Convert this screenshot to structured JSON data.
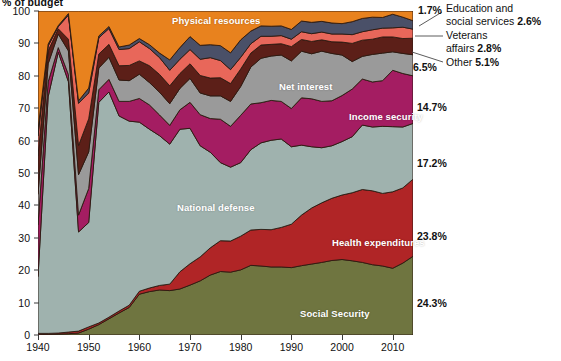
{
  "title": "% of budget",
  "axes": {
    "y_ticks": [
      0,
      10,
      20,
      30,
      40,
      50,
      60,
      70,
      80,
      90,
      100
    ],
    "x_ticks": [
      1940,
      1950,
      1960,
      1970,
      1980,
      1990,
      2000,
      2010
    ],
    "ylim": [
      0,
      100
    ],
    "xlim": [
      1940,
      2014
    ]
  },
  "series_labels": {
    "physical_resources": "Physical resources",
    "net_interest": "Net interest",
    "income_security": "Income security",
    "national_defense": "National defense",
    "health_expenditures": "Health expenditures",
    "social_security": "Social Security"
  },
  "callouts": {
    "p_17": "1.7%",
    "p_65": "6.5%",
    "p_147": "14.7%",
    "p_172": "17.2%",
    "p_238": "23.8%",
    "p_243": "24.3%",
    "education_line1": "Education and",
    "education_line2": "social services",
    "education_value": "2.6%",
    "veterans_line1": "Veterans",
    "veterans_line2": "affairs",
    "veterans_value": "2.8%",
    "other_label": "Other",
    "other_value": "5.1%"
  },
  "colors": {
    "social_security": "#6f7540",
    "health_expenditures": "#b02526",
    "national_defense": "#9fb2ae",
    "income_security": "#a41d62",
    "net_interest": "#9a9a9a",
    "other": "#5c1f18",
    "veterans": "#e8675a",
    "education": "#4a5068",
    "physical_resources": "#e8821e",
    "outline": "#2b1a12",
    "axis": "#3a3a3a",
    "background": "#ffffff",
    "label_text": "#ffffff"
  },
  "chart_data": {
    "type": "area",
    "title": "% of budget",
    "xlabel": "",
    "ylabel": "% of budget",
    "ylim": [
      0,
      100
    ],
    "xlim": [
      1940,
      2014
    ],
    "grid": false,
    "legend": "in-plot labels",
    "stacked": true,
    "normalized_percent": true,
    "x": [
      1940,
      1942,
      1944,
      1946,
      1948,
      1950,
      1952,
      1954,
      1956,
      1958,
      1960,
      1962,
      1964,
      1966,
      1968,
      1970,
      1972,
      1974,
      1976,
      1978,
      1980,
      1982,
      1984,
      1986,
      1988,
      1990,
      1992,
      1994,
      1996,
      1998,
      2000,
      2002,
      2004,
      2006,
      2008,
      2010,
      2012,
      2014
    ],
    "stack_order_bottom_to_top": [
      "Social Security",
      "Health expenditures",
      "National defense",
      "Income security",
      "Net interest",
      "Other",
      "Veterans affairs",
      "Education and social services",
      "Physical resources"
    ],
    "series": [
      {
        "name": "Social Security",
        "color": "#6f7540",
        "final_pct": 24.3,
        "values": [
          0.1,
          0.2,
          0.3,
          0.4,
          0.6,
          1.8,
          3.2,
          5.0,
          6.8,
          8.5,
          12.6,
          13.4,
          13.9,
          13.7,
          14.2,
          15.4,
          16.7,
          18.5,
          19.6,
          19.4,
          20.1,
          21.5,
          21.3,
          21.0,
          21.0,
          20.8,
          21.4,
          21.9,
          22.4,
          23.0,
          23.3,
          22.9,
          22.4,
          21.7,
          21.3,
          20.6,
          22.2,
          24.3
        ]
      },
      {
        "name": "Health expenditures",
        "color": "#b02526",
        "final_pct": 23.8,
        "values": [
          0.4,
          0.3,
          0.3,
          0.5,
          0.6,
          0.7,
          0.5,
          0.5,
          0.6,
          0.7,
          0.9,
          1.1,
          1.4,
          2.0,
          5.3,
          6.6,
          7.4,
          8.4,
          9.5,
          9.6,
          10.4,
          10.9,
          11.3,
          11.5,
          12.2,
          13.4,
          15.6,
          17.3,
          18.4,
          19.2,
          19.9,
          21.0,
          22.5,
          22.8,
          22.4,
          23.6,
          23.2,
          23.8
        ]
      },
      {
        "name": "National defense",
        "color": "#9fb2ae",
        "final_pct": 17.2,
        "values": [
          17.5,
          73.0,
          86.7,
          77.3,
          30.6,
          32.2,
          68.1,
          69.5,
          60.2,
          56.8,
          52.2,
          49.0,
          46.2,
          43.2,
          44.0,
          41.8,
          34.3,
          29.5,
          24.1,
          22.8,
          22.7,
          24.8,
          26.7,
          27.6,
          27.3,
          23.9,
          21.6,
          18.9,
          17.0,
          16.2,
          16.5,
          17.3,
          19.9,
          19.7,
          20.7,
          20.1,
          18.8,
          17.2
        ]
      },
      {
        "name": "Income security",
        "color": "#a41d62",
        "final_pct": 14.7,
        "values": [
          16.0,
          4.6,
          1.4,
          2.2,
          5.2,
          10.5,
          3.9,
          3.9,
          4.5,
          6.1,
          7.3,
          7.5,
          6.4,
          5.8,
          6.0,
          8.0,
          9.6,
          10.4,
          13.4,
          12.6,
          14.6,
          14.1,
          12.4,
          12.3,
          11.6,
          11.8,
          14.6,
          14.8,
          14.3,
          13.9,
          14.2,
          14.7,
          14.2,
          13.9,
          14.1,
          17.4,
          16.5,
          14.7
        ]
      },
      {
        "name": "Net interest",
        "color": "#9a9a9a",
        "final_pct": 6.5,
        "values": [
          9.4,
          5.6,
          4.2,
          7.3,
          12.5,
          11.3,
          6.7,
          6.8,
          6.6,
          6.4,
          7.5,
          6.9,
          7.0,
          6.7,
          6.6,
          7.4,
          6.7,
          7.0,
          7.2,
          7.7,
          8.9,
          11.4,
          13.7,
          13.7,
          14.3,
          14.7,
          14.4,
          13.9,
          15.5,
          14.6,
          12.5,
          8.5,
          7.0,
          8.5,
          8.5,
          5.7,
          6.2,
          6.5
        ]
      },
      {
        "name": "Other",
        "color": "#5c1f18",
        "final_pct": 5.1,
        "values": [
          12.0,
          4.0,
          1.6,
          3.6,
          9.0,
          10.2,
          4.3,
          4.0,
          4.4,
          4.7,
          4.1,
          5.2,
          5.5,
          5.5,
          4.6,
          4.5,
          5.4,
          5.5,
          5.6,
          5.5,
          5.4,
          4.3,
          4.1,
          3.6,
          3.5,
          4.4,
          3.6,
          3.8,
          3.5,
          3.6,
          4.0,
          5.6,
          5.0,
          4.7,
          5.0,
          4.6,
          4.6,
          5.1
        ]
      },
      {
        "name": "Veterans affairs",
        "color": "#e8675a",
        "final_pct": 2.8,
        "values": [
          6.0,
          1.5,
          0.7,
          7.4,
          13.0,
          8.0,
          5.0,
          4.9,
          5.0,
          5.2,
          5.9,
          5.3,
          5.2,
          4.8,
          4.4,
          4.4,
          5.0,
          6.3,
          5.3,
          4.3,
          3.6,
          2.9,
          2.7,
          2.5,
          2.5,
          2.3,
          2.4,
          2.4,
          2.4,
          2.4,
          2.5,
          2.7,
          2.6,
          2.9,
          2.7,
          2.8,
          3.5,
          2.8
        ]
      },
      {
        "name": "Education and social services",
        "color": "#4a5068",
        "final_pct": 2.6,
        "values": [
          2.0,
          0.6,
          0.3,
          0.5,
          0.8,
          1.5,
          0.6,
          0.6,
          0.8,
          1.1,
          1.0,
          1.2,
          1.4,
          3.2,
          3.6,
          4.0,
          4.3,
          4.0,
          4.6,
          5.2,
          5.4,
          3.9,
          3.2,
          3.1,
          3.0,
          3.0,
          3.3,
          3.5,
          3.3,
          3.4,
          3.2,
          4.0,
          4.1,
          3.9,
          3.3,
          4.2,
          3.1,
          2.6
        ]
      },
      {
        "name": "Physical resources",
        "color": "#e8821e",
        "final_pct": 3.0,
        "values": [
          36.6,
          10.2,
          4.5,
          0.8,
          27.7,
          23.8,
          7.7,
          4.8,
          11.1,
          10.5,
          8.5,
          10.4,
          13.0,
          15.1,
          11.3,
          7.9,
          10.6,
          10.4,
          10.7,
          12.9,
          8.9,
          6.2,
          4.6,
          4.7,
          4.6,
          5.7,
          3.1,
          3.5,
          3.2,
          3.7,
          3.9,
          3.3,
          2.3,
          1.9,
          2.0,
          1.0,
          1.9,
          3.0
        ]
      }
    ],
    "annotations": [
      {
        "text": "1.7%",
        "at_series": "Education and social services",
        "note": "right-edge callout"
      },
      {
        "text": "Education and social services 2.6%",
        "at_series": "Education and social services"
      },
      {
        "text": "Veterans affairs 2.8%",
        "at_series": "Veterans affairs"
      },
      {
        "text": "Other 5.1%",
        "at_series": "Other"
      },
      {
        "text": "6.5%",
        "at_series": "Net interest"
      },
      {
        "text": "14.7%",
        "at_series": "Income security"
      },
      {
        "text": "17.2%",
        "at_series": "National defense"
      },
      {
        "text": "23.8%",
        "at_series": "Health expenditures"
      },
      {
        "text": "24.3%",
        "at_series": "Social Security"
      }
    ]
  }
}
